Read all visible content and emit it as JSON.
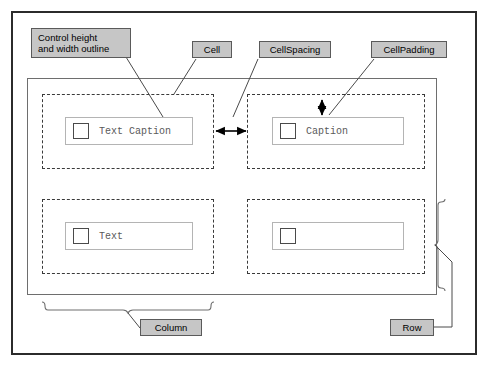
{
  "diagram": {
    "colors": {
      "callout_fill": "#c6c6c6",
      "callout_border": "#5a5a5a",
      "frame": "#2b2b2b",
      "cell_dashed": "#3a3a3a",
      "control_outline": "#b4b4b4",
      "caption_text": "#5a5a5a"
    }
  },
  "callouts": {
    "control_outline": {
      "line1": "Control height",
      "line2": "and width outline"
    },
    "cell": "Cell",
    "cell_spacing": "CellSpacing",
    "cell_padding": "CellPadding",
    "column": "Column",
    "row": "Row"
  },
  "cells": [
    {
      "id": "r1c1",
      "control": {
        "checkbox": true,
        "caption": "Text Caption"
      }
    },
    {
      "id": "r1c2",
      "control": {
        "checkbox": true,
        "caption": "Caption"
      }
    },
    {
      "id": "r2c1",
      "control": {
        "checkbox": true,
        "caption": "Text"
      }
    },
    {
      "id": "r2c2",
      "control": {
        "checkbox": true,
        "caption": ""
      }
    }
  ],
  "annotations": {
    "spacing_arrow": "horizontal-double-arrow",
    "padding_arrow": "vertical-double-arrow",
    "column_brace": "horizontal-curly-brace",
    "row_brace": "vertical-curly-brace"
  }
}
